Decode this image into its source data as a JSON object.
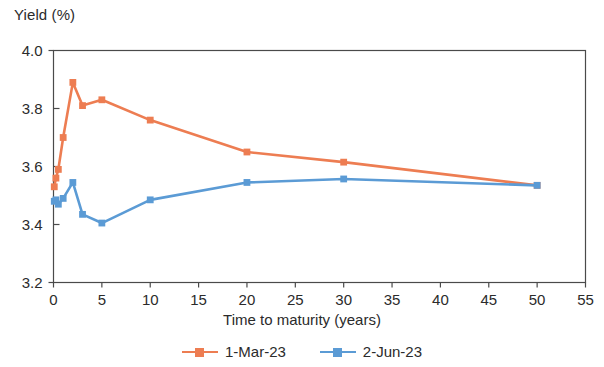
{
  "chart_data": {
    "type": "line",
    "title": "",
    "xlabel": "Time to maturity (years)",
    "ylabel": "Yield (%)",
    "xlim": [
      0,
      55
    ],
    "ylim": [
      3.2,
      4.0
    ],
    "xticks": [
      0,
      5,
      10,
      15,
      20,
      25,
      30,
      35,
      40,
      45,
      50,
      55
    ],
    "xtick_labels": [
      "0",
      "5",
      "10",
      "15",
      "20",
      "25",
      "30",
      "35",
      "40",
      "45",
      "50",
      "55"
    ],
    "yticks": [
      3.2,
      3.4,
      3.6,
      3.8,
      4.0
    ],
    "ytick_labels": [
      "3.2",
      "3.4",
      "3.6",
      "3.8",
      "4.0"
    ],
    "grid": false,
    "legend_position": "bottom",
    "series": [
      {
        "name": "1-Mar-23",
        "color": "#ED7D52",
        "marker": "square",
        "x": [
          0.08,
          0.25,
          0.5,
          1,
          2,
          3,
          5,
          10,
          20,
          30,
          50
        ],
        "values": [
          3.53,
          3.56,
          3.59,
          3.7,
          3.89,
          3.81,
          3.83,
          3.76,
          3.65,
          3.615,
          3.535
        ]
      },
      {
        "name": "2-Jun-23",
        "color": "#5B9BD5",
        "marker": "square",
        "x": [
          0.08,
          0.25,
          0.5,
          1,
          2,
          3,
          5,
          10,
          20,
          30,
          50
        ],
        "values": [
          3.48,
          3.485,
          3.47,
          3.49,
          3.545,
          3.435,
          3.405,
          3.485,
          3.545,
          3.557,
          3.535
        ]
      }
    ]
  },
  "axes": {
    "y_title": "Yield (%)",
    "x_title": "Time to maturity (years)"
  },
  "legend": {
    "items": [
      {
        "label": "1-Mar-23",
        "color": "#ED7D52"
      },
      {
        "label": "2-Jun-23",
        "color": "#5B9BD5"
      }
    ]
  }
}
